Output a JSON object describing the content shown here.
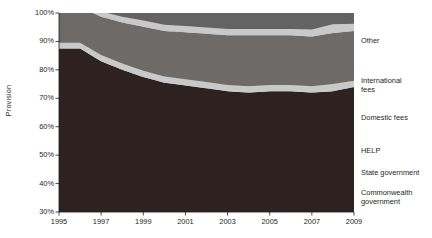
{
  "chart": {
    "type": "area",
    "ylabel": "Provision",
    "xlabel": "",
    "title": ""
  },
  "axis": {
    "y_ticks": [
      "100%",
      "90%",
      "80%",
      "70%",
      "60%",
      "50%",
      "40%",
      "30%"
    ],
    "x_ticks": [
      "1995",
      "1997",
      "1999",
      "2001",
      "2003",
      "2005",
      "2007",
      "2009"
    ]
  },
  "legend": {
    "items": [
      {
        "label": "Other",
        "color": "#d9d9d9"
      },
      {
        "label": "International\nfees",
        "color": "#636363"
      },
      {
        "label": "Domestic fees",
        "color": "#c9c9c9"
      },
      {
        "label": "HELP",
        "color": "#6e6a68"
      },
      {
        "label": "State government",
        "color": "#c9c9c9"
      },
      {
        "label": "Commonwealth\ngovernment",
        "color": "#2e2220"
      }
    ]
  },
  "chart_data": {
    "type": "area",
    "stacked": true,
    "title": "",
    "xlabel": "",
    "ylabel": "Provision",
    "ylim": [
      30,
      100
    ],
    "grid": false,
    "legend_position": "right",
    "x": [
      1995,
      1996,
      1997,
      1998,
      1999,
      2000,
      2001,
      2002,
      2003,
      2004,
      2005,
      2006,
      2007,
      2008,
      2009
    ],
    "series": [
      {
        "name": "Commonwealth government",
        "color": "#2e2220",
        "values": [
          57.5,
          57.5,
          53.0,
          50.0,
          47.5,
          45.5,
          44.5,
          43.5,
          42.5,
          42.0,
          42.5,
          42.5,
          42.0,
          42.5,
          44.0
        ]
      },
      {
        "name": "State government",
        "color": "#c9c9c9",
        "values": [
          2.0,
          2.0,
          2.2,
          2.2,
          2.2,
          2.2,
          2.2,
          2.2,
          2.2,
          2.2,
          2.2,
          2.2,
          2.2,
          2.5,
          2.2
        ]
      },
      {
        "name": "HELP",
        "color": "#6e6a68",
        "values": [
          12.5,
          12.5,
          13.5,
          14.5,
          15.5,
          16.0,
          16.5,
          17.0,
          17.5,
          18.0,
          17.5,
          17.5,
          17.5,
          18.0,
          17.5
        ]
      },
      {
        "name": "Domestic fees",
        "color": "#c9c9c9",
        "values": [
          1.5,
          1.5,
          1.8,
          2.0,
          2.2,
          2.2,
          2.2,
          2.2,
          2.2,
          2.2,
          2.2,
          2.2,
          2.5,
          3.0,
          2.5
        ]
      },
      {
        "name": "International fees",
        "color": "#636363",
        "values": [
          6.5,
          7.0,
          8.0,
          9.5,
          10.5,
          11.5,
          13.0,
          14.8,
          15.5,
          16.0,
          15.5,
          15.5,
          16.0,
          15.5,
          15.0
        ]
      },
      {
        "name": "Other",
        "color": "#d9d9d9",
        "values": [
          20.0,
          19.5,
          21.5,
          21.8,
          22.1,
          22.6,
          21.6,
          20.3,
          20.1,
          19.6,
          20.1,
          20.1,
          19.8,
          18.5,
          18.8
        ]
      }
    ]
  },
  "geometry": {
    "plot_left": 59,
    "plot_right": 354,
    "plot_top": 13,
    "plot_bottom": 212
  }
}
